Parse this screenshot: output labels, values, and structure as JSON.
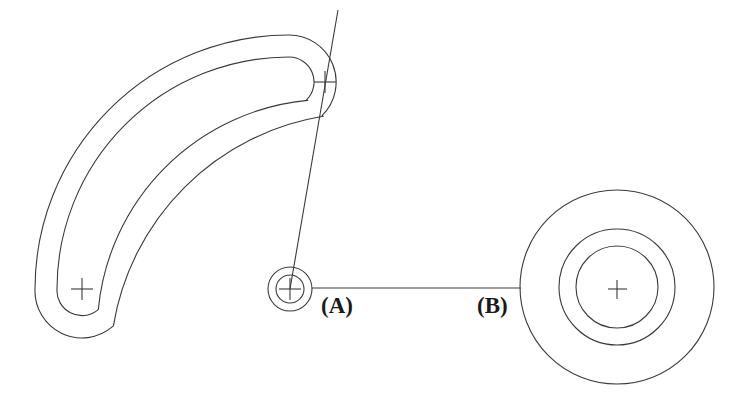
{
  "drawing": {
    "title": "Curved slot and bore layout drawing",
    "background_color": "#ffffff",
    "line_color": "#3a3a3a",
    "text_color": "#1a1a1a",
    "stroke_width": 1.1,
    "width": 747,
    "height": 399
  },
  "labels": {
    "a": "(A)",
    "b": "(B)"
  },
  "features": {
    "curved_slot": {
      "name": "curved-slot",
      "arc_center": {
        "x": 325,
        "y": 289
      },
      "arc_radius": 207,
      "start_angle_deg": 180,
      "end_angle_deg": 268,
      "inner_offset": 25,
      "outer_offset": 47,
      "end_cross_top_right": {
        "x": 325,
        "y": 82
      },
      "end_cross_bottom_left": {
        "x": 82,
        "y": 289
      }
    },
    "bore_a": {
      "name": "bore-a",
      "center": {
        "x": 290,
        "y": 289
      },
      "radii": [
        22,
        14
      ]
    },
    "bore_b": {
      "name": "bore-b",
      "center": {
        "x": 617,
        "y": 287
      },
      "radii": [
        97,
        58,
        41
      ]
    },
    "centre_line_horizontal": {
      "name": "horizontal-centre-line",
      "x1": 312,
      "y1": 288,
      "x2": 521,
      "y2": 288
    },
    "centre_line_angled": {
      "name": "angled-centre-line",
      "x1": 338,
      "y1": 10,
      "x2": 290,
      "y2": 289
    },
    "cross_marks": [
      {
        "name": "cross-mark-slot-top",
        "x": 325,
        "y": 82,
        "size": 11
      },
      {
        "name": "cross-mark-slot-bottom",
        "x": 82,
        "y": 289,
        "size": 11
      },
      {
        "name": "cross-mark-bore-a",
        "x": 290,
        "y": 289,
        "size": 11
      },
      {
        "name": "cross-mark-bore-b",
        "x": 617,
        "y": 289,
        "size": 11
      }
    ]
  }
}
